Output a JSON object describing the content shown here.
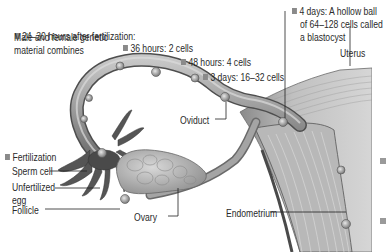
{
  "diagram": {
    "type": "anatomical-illustration",
    "stages": [
      {
        "id": "fert",
        "text": "Fertilization",
        "bulleted": true
      },
      {
        "id": "s24",
        "text": "24–30 hours after fertilization:",
        "text2": "Male and female genetic",
        "text3": "material combines",
        "bulleted": true
      },
      {
        "id": "s36",
        "text": "36 hours: 2 cells",
        "bulleted": true
      },
      {
        "id": "s48",
        "text": "48 hours: 4 cells",
        "bulleted": true
      },
      {
        "id": "s3d",
        "text": "3 days: 16–32 cells",
        "bulleted": true
      },
      {
        "id": "s4d",
        "text": "4 days: A hollow ball",
        "text2": "of 64–128 cells called",
        "text3": "a blastocyst",
        "bulleted": true
      }
    ],
    "structures": {
      "sperm_cell": "Sperm cell",
      "unfertilized_egg_1": "Unfertilized",
      "unfertilized_egg_2": "egg",
      "follicle": "Follicle",
      "ovary": "Ovary",
      "oviduct": "Oviduct",
      "uterus": "Uterus",
      "endometrium": "Endometrium"
    },
    "colors": {
      "tube_fill": "#a8a8a8",
      "tube_dark": "#6e6e6e",
      "fimbriae": "#5a5a5a",
      "ovary": "#b8b8b8",
      "uterus_wall": "#c4c4c4",
      "endometrium": "#b0b0b0",
      "leader_line": "#222222",
      "bullet": "#8a8a8a"
    }
  }
}
